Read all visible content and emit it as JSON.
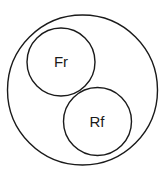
{
  "diagram": {
    "type": "nested-circles",
    "outer": {
      "label": ""
    },
    "circles": [
      {
        "label": "Fr"
      },
      {
        "label": "Rf"
      }
    ],
    "stroke_color": "#1a1a1a",
    "background": "#ffffff"
  }
}
